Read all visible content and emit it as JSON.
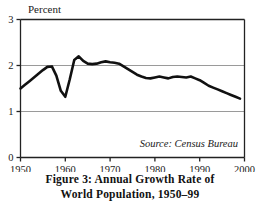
{
  "figure": {
    "caption_line1": "Figure 3: Annual Growth Rate of",
    "caption_line2": "World Population, 1950–99",
    "source_note": "Source: Census Bureau",
    "axis_unit_label": "Percent"
  },
  "style": {
    "line_color": "#111111",
    "grid_color": "#9a9a9a",
    "frame_color": "#222222",
    "background": "#ffffff",
    "text_color": "#1a1a1a"
  },
  "chart_data": {
    "type": "line",
    "title": "Figure 3: Annual Growth Rate of World Population, 1950–99",
    "subtitle": "",
    "xlabel": "",
    "ylabel": "Percent",
    "ylim": [
      0,
      3
    ],
    "xlim": [
      1950,
      2000
    ],
    "yticks": [
      0,
      1,
      2,
      3
    ],
    "ytick_labels": [
      "0",
      "1",
      "2",
      "3"
    ],
    "xticks": [
      1950,
      1960,
      1970,
      1980,
      1990,
      2000
    ],
    "xtick_labels": [
      "1950",
      "1960",
      "1970",
      "1980",
      "1990",
      "2000"
    ],
    "gridlines_y": [
      1,
      2
    ],
    "grid": true,
    "legend": false,
    "legend_position": "none",
    "annotations": [
      {
        "text": "Source: Census Bureau",
        "x": 1996,
        "y": 0.27,
        "style": "italic"
      },
      {
        "text": "Percent",
        "x": 1951,
        "y": 3.18,
        "style": "plain"
      }
    ],
    "series": [
      {
        "name": "World population annual growth rate",
        "units": "percent per year",
        "x": [
          1950,
          1951,
          1952,
          1953,
          1954,
          1955,
          1956,
          1957,
          1958,
          1959,
          1960,
          1961,
          1962,
          1963,
          1964,
          1965,
          1966,
          1967,
          1968,
          1969,
          1970,
          1971,
          1972,
          1973,
          1974,
          1975,
          1976,
          1977,
          1978,
          1979,
          1980,
          1981,
          1982,
          1983,
          1984,
          1985,
          1986,
          1987,
          1988,
          1989,
          1990,
          1991,
          1992,
          1993,
          1994,
          1995,
          1996,
          1997,
          1998,
          1999
        ],
        "values": [
          1.5,
          1.58,
          1.66,
          1.74,
          1.82,
          1.9,
          1.97,
          1.98,
          1.78,
          1.45,
          1.32,
          1.7,
          2.12,
          2.2,
          2.1,
          2.04,
          2.03,
          2.04,
          2.07,
          2.09,
          2.07,
          2.06,
          2.04,
          1.98,
          1.92,
          1.86,
          1.8,
          1.76,
          1.73,
          1.72,
          1.74,
          1.76,
          1.74,
          1.72,
          1.75,
          1.76,
          1.75,
          1.74,
          1.76,
          1.72,
          1.68,
          1.62,
          1.56,
          1.52,
          1.48,
          1.44,
          1.4,
          1.36,
          1.32,
          1.28
        ]
      }
    ]
  }
}
